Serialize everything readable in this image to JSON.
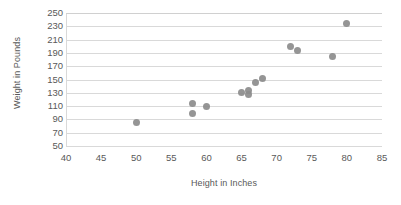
{
  "chart_data": {
    "type": "scatter",
    "title": "",
    "xlabel": "Height in Inches",
    "ylabel": "Weight in Pounds",
    "xlim": [
      40,
      85
    ],
    "ylim": [
      50,
      250
    ],
    "xticks": [
      40,
      45,
      50,
      55,
      60,
      65,
      70,
      75,
      80,
      85
    ],
    "yticks": [
      50,
      70,
      90,
      110,
      130,
      150,
      170,
      190,
      210,
      230,
      250
    ],
    "grid": "horizontal",
    "legend": "none",
    "marker_color": "#8c8c8c",
    "x": [
      50,
      58,
      58,
      60,
      65,
      66,
      66,
      67,
      68,
      72,
      73,
      78,
      80
    ],
    "y": [
      85,
      114,
      99,
      110,
      131,
      133,
      127,
      145,
      151,
      200,
      193,
      184,
      234
    ],
    "points": [
      {
        "x": 50,
        "y": 85
      },
      {
        "x": 58,
        "y": 114
      },
      {
        "x": 58,
        "y": 99
      },
      {
        "x": 60,
        "y": 110
      },
      {
        "x": 65,
        "y": 131
      },
      {
        "x": 66,
        "y": 133
      },
      {
        "x": 66,
        "y": 127
      },
      {
        "x": 67,
        "y": 145
      },
      {
        "x": 68,
        "y": 151
      },
      {
        "x": 72,
        "y": 200
      },
      {
        "x": 73,
        "y": 193
      },
      {
        "x": 78,
        "y": 184
      },
      {
        "x": 80,
        "y": 234
      }
    ]
  }
}
